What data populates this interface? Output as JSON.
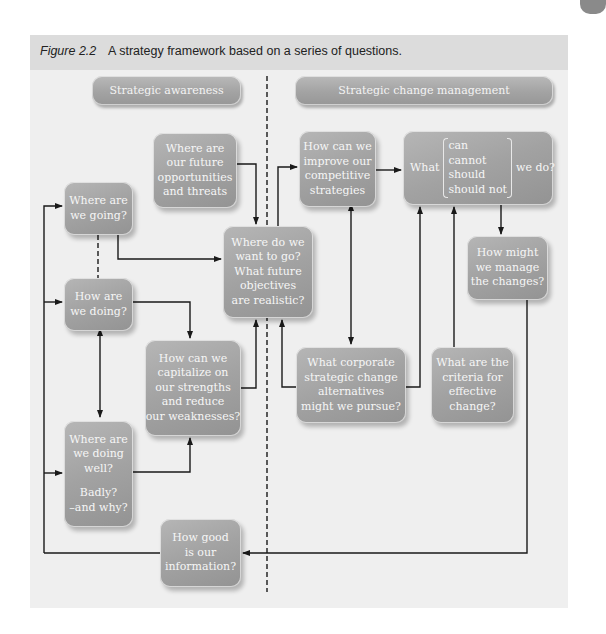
{
  "caption": {
    "figure_label": "Figure 2.2",
    "text": "A strategy framework based on a series of questions."
  },
  "headers": {
    "left": "Strategic awareness",
    "right": "Strategic change management"
  },
  "boxes": {
    "future_opportunities": [
      "Where are",
      "our future",
      "opportunities",
      "and threats"
    ],
    "where_going": [
      "Where are",
      "we going?"
    ],
    "where_want": [
      "Where do we",
      "want to go?",
      "What future",
      "objectives",
      "are realistic?"
    ],
    "how_doing": [
      "How are",
      "we doing?"
    ],
    "capitalize": [
      "How can we",
      "capitalize on",
      "our strengths",
      "and reduce",
      "our weaknesses?"
    ],
    "doing_well": [
      "Where are",
      "we doing",
      "well?",
      "Badly?",
      "–and why?"
    ],
    "information": [
      "How good",
      "is our",
      "information?"
    ],
    "improve": [
      "How can we",
      "improve our",
      "competitive",
      "strategies"
    ],
    "what": {
      "lead": "What",
      "options": [
        "can",
        "cannot",
        "should",
        "should not"
      ],
      "tail": "we do?"
    },
    "manage": [
      "How might",
      "we manage",
      "the changes?"
    ],
    "corporate": [
      "What corporate",
      "strategic change",
      "alternatives",
      "might we pursue?"
    ],
    "criteria": [
      "What are the",
      "criteria for",
      "effective",
      "change?"
    ]
  },
  "colors": {
    "panel": "#efefef",
    "caption_band": "#dcdcdc",
    "box": "#a3a3a3",
    "box_text": "#f6f6f6",
    "line": "#1a1a1a"
  }
}
